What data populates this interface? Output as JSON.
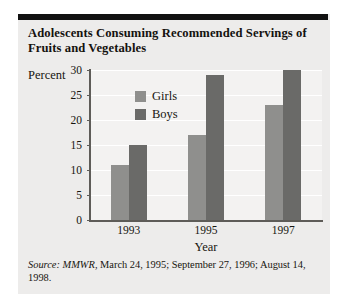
{
  "card": {
    "title": "Adolescents Consuming Recommended Servings of Fruits and Vegetables",
    "source_prefix": "Source:",
    "source_publication": "MMWR",
    "source_rest": ", March 24, 1995; September 27, 1996; August 14, 1998."
  },
  "chart_data": {
    "type": "bar",
    "title": "Adolescents Consuming Recommended Servings of Fruits and Vegetables",
    "categories": [
      "1993",
      "1995",
      "1997"
    ],
    "series": [
      {
        "name": "Girls",
        "values": [
          11,
          17,
          23
        ],
        "color": "#8f8f8d"
      },
      {
        "name": "Boys",
        "values": [
          15,
          29,
          30
        ],
        "color": "#6a6a68"
      }
    ],
    "xlabel": "Year",
    "ylabel": "Percent",
    "ylim": [
      0,
      30
    ],
    "yticks": [
      0,
      5,
      10,
      15,
      20,
      25,
      30
    ],
    "ytick_labels": [
      "0",
      "5",
      "10",
      "15",
      "20",
      "25",
      "30"
    ],
    "grid": true,
    "legend_position": "inside-upper-left"
  }
}
